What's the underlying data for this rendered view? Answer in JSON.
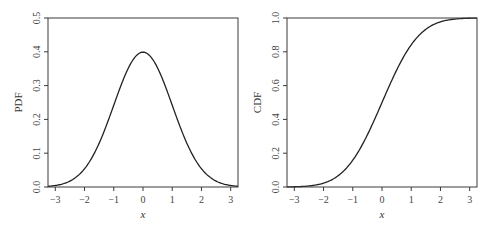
{
  "chart_data": [
    {
      "type": "line",
      "title": "",
      "xlabel": "x",
      "ylabel": "PDF",
      "xlim": [
        -3.25,
        3.25
      ],
      "ylim": [
        0.0,
        0.5
      ],
      "xticks": [
        -3,
        -2,
        -1,
        0,
        1,
        2,
        3
      ],
      "xtick_labels": [
        "−3",
        "−2",
        "−1",
        "0",
        "1",
        "2",
        "3"
      ],
      "yticks": [
        0.0,
        0.1,
        0.2,
        0.3,
        0.4,
        0.5
      ],
      "ytick_labels": [
        "0.0",
        "0.1",
        "0.2",
        "0.3",
        "0.4",
        "0.5"
      ],
      "grid": false,
      "legend": null,
      "series": [
        {
          "name": "Standard normal PDF",
          "function": "pdf",
          "x": [
            -3.25,
            -3,
            -2.5,
            -2,
            -1.5,
            -1,
            -0.5,
            0,
            0.5,
            1,
            1.5,
            2,
            2.5,
            3,
            3.25
          ],
          "values": [
            0.002,
            0.004,
            0.018,
            0.054,
            0.13,
            0.242,
            0.352,
            0.399,
            0.352,
            0.242,
            0.13,
            0.054,
            0.018,
            0.004,
            0.002
          ]
        }
      ]
    },
    {
      "type": "line",
      "title": "",
      "xlabel": "x",
      "ylabel": "CDF",
      "xlim": [
        -3.25,
        3.25
      ],
      "ylim": [
        0.0,
        1.0
      ],
      "xticks": [
        -3,
        -2,
        -1,
        0,
        1,
        2,
        3
      ],
      "xtick_labels": [
        "−3",
        "−2",
        "−1",
        "0",
        "1",
        "2",
        "3"
      ],
      "yticks": [
        0.0,
        0.2,
        0.4,
        0.6,
        0.8,
        1.0
      ],
      "ytick_labels": [
        "0.0",
        "0.2",
        "0.4",
        "0.6",
        "0.8",
        "1.0"
      ],
      "grid": false,
      "legend": null,
      "series": [
        {
          "name": "Standard normal CDF",
          "function": "cdf",
          "x": [
            -3.25,
            -3,
            -2.5,
            -2,
            -1.5,
            -1,
            -0.5,
            0,
            0.5,
            1,
            1.5,
            2,
            2.5,
            3,
            3.25
          ],
          "values": [
            0.001,
            0.001,
            0.006,
            0.023,
            0.067,
            0.159,
            0.309,
            0.5,
            0.691,
            0.841,
            0.933,
            0.977,
            0.994,
            0.999,
            0.999
          ]
        }
      ]
    }
  ],
  "panels": [
    {
      "ylabel": "PDF",
      "xlabel": "x"
    },
    {
      "ylabel": "CDF",
      "xlabel": "x"
    }
  ],
  "layout": {
    "panels_px": [
      {
        "left": 48,
        "top": 18,
        "right": 238,
        "bottom": 187
      },
      {
        "left": 287,
        "top": 18,
        "right": 477,
        "bottom": 187
      }
    ]
  }
}
